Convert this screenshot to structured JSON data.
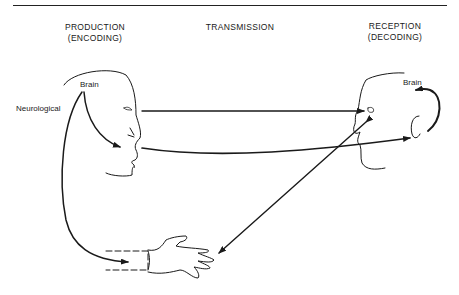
{
  "diagram": {
    "columns": [
      {
        "line1": "PRODUCTION",
        "line2": "(ENCODING)"
      },
      {
        "line1": "TRANSMISSION",
        "line2": ""
      },
      {
        "line1": "RECEPTION",
        "line2": "(DECODING)"
      }
    ],
    "labels": {
      "speaker_brain": "Brain",
      "neurological": "Neurological",
      "listener_brain": "Brain"
    },
    "nodes": [
      "speaker-head",
      "listener-head",
      "hand"
    ],
    "arrows": [
      {
        "from": "speaker-eye",
        "to": "listener-eye"
      },
      {
        "from": "speaker-mouth",
        "to": "listener-ear"
      },
      {
        "from": "speaker-brain",
        "to": "speaker-mouth"
      },
      {
        "from": "speaker-brain",
        "to": "hand"
      },
      {
        "from": "listener-eye",
        "to": "hand",
        "bidirectional": true
      },
      {
        "from": "listener-ear",
        "to": "listener-brain"
      }
    ],
    "colors": {
      "ink": "#1a1a1a",
      "background": "#ffffff"
    }
  }
}
